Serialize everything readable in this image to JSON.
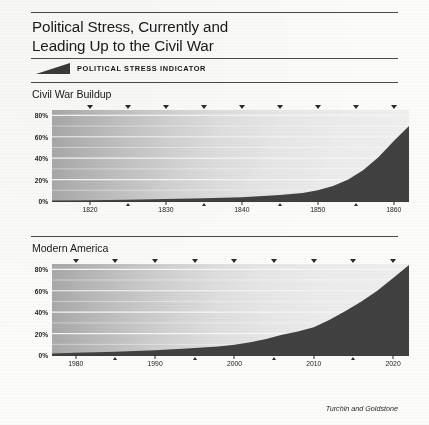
{
  "header": {
    "title_line1": "Political Stress, Currently and",
    "title_line2": "Leading Up to the Civil War"
  },
  "legend": {
    "swatch_icon": "rising-wedge-icon",
    "label": "POLITICAL STRESS INDICATOR",
    "color": "#3a3a3a"
  },
  "credit": "Turchin and Goldstone",
  "colors": {
    "area_fill": "#414141",
    "gradient_left": "#a9a9a9",
    "gradient_right": "#eeeeee",
    "gridline": "#f4f4f4",
    "axis": "#3d3d3d",
    "paper": "#fbfbf9"
  },
  "chart_data": [
    {
      "type": "area",
      "title": "Civil War Buildup",
      "xlabel": "",
      "ylabel": "",
      "xlim": [
        1815,
        1862
      ],
      "ylim": [
        0,
        85
      ],
      "grid": true,
      "legend_position": "top",
      "ytick_labels": [
        "80%",
        "60%",
        "40%",
        "20%",
        "0%"
      ],
      "ytick_values": [
        80,
        60,
        40,
        20,
        0
      ],
      "xtick_labels": [
        "1820",
        "1830",
        "1840",
        "1850",
        "1860"
      ],
      "xtick_values": [
        1820,
        1830,
        1840,
        1850,
        1860
      ],
      "xminor_values": [
        1825,
        1835,
        1845,
        1855
      ],
      "series": [
        {
          "name": "Political Stress Indicator",
          "x": [
            1815,
            1820,
            1825,
            1830,
            1835,
            1840,
            1845,
            1848,
            1850,
            1852,
            1854,
            1856,
            1858,
            1860,
            1862
          ],
          "values": [
            0.5,
            0.8,
            1.2,
            1.8,
            2.5,
            3.5,
            5.5,
            7.5,
            10,
            14,
            20,
            29,
            41,
            56,
            70
          ]
        }
      ]
    },
    {
      "type": "area",
      "title": "Modern America",
      "xlabel": "",
      "ylabel": "",
      "xlim": [
        1977,
        2022
      ],
      "ylim": [
        0,
        85
      ],
      "grid": true,
      "legend_position": "top",
      "ytick_labels": [
        "80%",
        "60%",
        "40%",
        "20%",
        "0%"
      ],
      "ytick_values": [
        80,
        60,
        40,
        20,
        0
      ],
      "xtick_labels": [
        "1980",
        "1990",
        "2000",
        "2010",
        "2020"
      ],
      "xtick_values": [
        1980,
        1990,
        2000,
        2010,
        2020
      ],
      "xminor_values": [
        1985,
        1995,
        2005,
        2015
      ],
      "series": [
        {
          "name": "Political Stress Indicator",
          "x": [
            1977,
            1980,
            1985,
            1990,
            1994,
            1998,
            2000,
            2002,
            2004,
            2006,
            2008,
            2010,
            2012,
            2014,
            2016,
            2018,
            2020,
            2022
          ],
          "values": [
            1.5,
            2,
            3,
            4.5,
            6,
            8,
            9.5,
            12,
            15,
            19,
            22,
            26,
            33,
            41,
            50,
            60,
            72,
            84
          ]
        }
      ]
    }
  ]
}
